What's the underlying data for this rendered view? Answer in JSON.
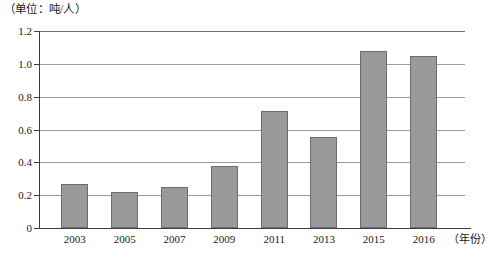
{
  "caption": {
    "unit_label": "（单位：吨/人）"
  },
  "axis": {
    "x_unit_label": "（年份）",
    "y_ticks": [
      "1.2",
      "1.0",
      "0.8",
      "0.6",
      "0.4",
      "0.2",
      "0"
    ]
  },
  "colors": {
    "bar_fill": "#9a9a9a",
    "bar_stroke": "#6d6d6d",
    "gridline": "#9b9b9b",
    "axis": "#3d3d3d",
    "text": "#1a1a1a",
    "background": "#ffffff"
  },
  "chart_data": {
    "type": "bar",
    "title": "",
    "subtitle": "",
    "xlabel": "（年份）",
    "ylabel": "（单位：吨/人）",
    "categories": [
      "2003",
      "2005",
      "2007",
      "2009",
      "2011",
      "2013",
      "2015",
      "2016"
    ],
    "values": [
      0.27,
      0.22,
      0.25,
      0.375,
      0.71,
      0.555,
      1.08,
      1.045
    ],
    "ylim": [
      0,
      1.2
    ],
    "y_ticks": [
      0,
      0.2,
      0.4,
      0.6,
      0.8,
      1.0,
      1.2
    ],
    "grid": true,
    "legend": "none",
    "series": [
      {
        "name": "人均量",
        "values": [
          0.27,
          0.22,
          0.25,
          0.375,
          0.71,
          0.555,
          1.08,
          1.045
        ]
      }
    ]
  }
}
